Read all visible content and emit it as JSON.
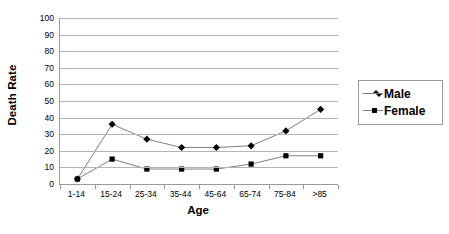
{
  "chart_data": {
    "type": "line",
    "title": "",
    "xlabel": "Age",
    "ylabel": "Death Rate",
    "categories": [
      "1-14",
      "15-24",
      "25-34",
      "35-44",
      "45-64",
      "65-74",
      "75-84",
      ">85"
    ],
    "series": [
      {
        "name": "Male",
        "marker": "diamond",
        "values": [
          3,
          36,
          27,
          22,
          22,
          23,
          32,
          45
        ]
      },
      {
        "name": "Female",
        "marker": "square",
        "values": [
          3,
          15,
          9,
          9,
          9,
          12,
          17,
          17
        ]
      }
    ],
    "ylim": [
      0,
      100
    ],
    "ytick_step": 10,
    "yticks": [
      0,
      10,
      20,
      30,
      40,
      50,
      60,
      70,
      80,
      90,
      100
    ],
    "grid": true,
    "legend_position": "right",
    "colors": {
      "series_line": "#7f7f7f",
      "marker": "#000000",
      "gridline": "#b4b4b4",
      "axis": "#9a9a9a",
      "text": "#000000",
      "background": "#ffffff"
    }
  }
}
